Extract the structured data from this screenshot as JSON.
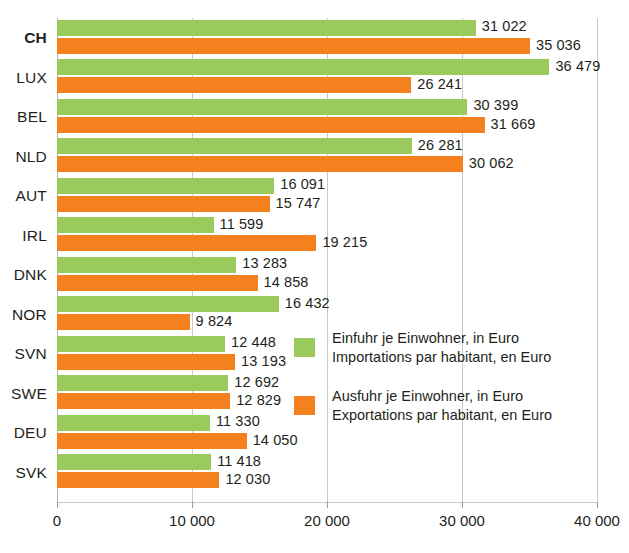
{
  "chart_data": {
    "type": "bar",
    "orientation": "horizontal",
    "title": "",
    "xlabel": "",
    "ylabel": "",
    "xlim": [
      0,
      40000
    ],
    "xticks": [
      0,
      10000,
      20000,
      30000,
      40000
    ],
    "xtick_labels": [
      "0",
      "10 000",
      "20 000",
      "30 000",
      "40 000"
    ],
    "grid": true,
    "legend_position": "inside-right",
    "categories": [
      "CH",
      "LUX",
      "BEL",
      "NLD",
      "AUT",
      "IRL",
      "DNK",
      "NOR",
      "SVN",
      "SWE",
      "DEU",
      "SVK"
    ],
    "series": [
      {
        "name": "Einfuhr je Einwohner, in Euro",
        "name_fr": "Importations par habitant, en Euro",
        "color": "#9ACA5C",
        "values": [
          31022,
          36479,
          30399,
          26281,
          16091,
          11599,
          13283,
          16432,
          12448,
          12692,
          11330,
          11418
        ],
        "value_labels": [
          "31 022",
          "36 479",
          "30 399",
          "26 281",
          "16 091",
          "11 599",
          "13 283",
          "16 432",
          "12 448",
          "12 692",
          "11 330",
          "11 418"
        ]
      },
      {
        "name": "Ausfuhr je Einwohner, in Euro",
        "name_fr": "Exportations par habitant, en Euro",
        "color": "#F5801E",
        "values": [
          35036,
          26241,
          31669,
          30062,
          15747,
          19215,
          14858,
          9824,
          13193,
          12829,
          14050,
          12030
        ],
        "value_labels": [
          "35 036",
          "26 241",
          "31 669",
          "30 062",
          "15 747",
          "19 215",
          "14 858",
          "9 824",
          "13 193",
          "12 829",
          "14 050",
          "12 030"
        ]
      }
    ]
  },
  "categories": [
    {
      "label": "CH",
      "emphasis": true,
      "green_label": "31 022",
      "orange_label": "35 036"
    },
    {
      "label": "LUX",
      "emphasis": false,
      "green_label": "36 479",
      "orange_label": "26 241"
    },
    {
      "label": "BEL",
      "emphasis": false,
      "green_label": "30 399",
      "orange_label": "31 669"
    },
    {
      "label": "NLD",
      "emphasis": false,
      "green_label": "26 281",
      "orange_label": "30 062"
    },
    {
      "label": "AUT",
      "emphasis": false,
      "green_label": "16 091",
      "orange_label": "15 747"
    },
    {
      "label": "IRL",
      "emphasis": false,
      "green_label": "11 599",
      "orange_label": "19 215"
    },
    {
      "label": "DNK",
      "emphasis": false,
      "green_label": "13 283",
      "orange_label": "14 858"
    },
    {
      "label": "NOR",
      "emphasis": false,
      "green_label": "16 432",
      "orange_label": "9 824"
    },
    {
      "label": "SVN",
      "emphasis": false,
      "green_label": "12 448",
      "orange_label": "13 193"
    },
    {
      "label": "SWE",
      "emphasis": false,
      "green_label": "12 692",
      "orange_label": "12 829"
    },
    {
      "label": "DEU",
      "emphasis": false,
      "green_label": "11 330",
      "orange_label": "14 050"
    },
    {
      "label": "SVK",
      "emphasis": false,
      "green_label": "11 418",
      "orange_label": "12 030"
    }
  ],
  "axis": {
    "tick_labels": [
      "0",
      "10 000",
      "20 000",
      "30 000",
      "40 000"
    ]
  },
  "legend": {
    "items": [
      {
        "swatch": "green",
        "line1": "Einfuhr je Einwohner, in Euro",
        "line2": "Importations par habitant, en Euro"
      },
      {
        "swatch": "orange",
        "line1": "Ausfuhr je Einwohner, in Euro",
        "line2": "Exportations par habitant, en Euro"
      }
    ]
  },
  "colors": {
    "green": "#9ACA5C",
    "orange": "#F5801E",
    "grid": "#c9c9c9",
    "text": "#231f20"
  }
}
